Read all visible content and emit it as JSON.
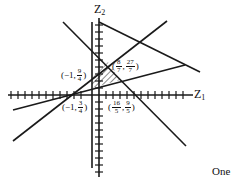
{
  "axes": {
    "x_label": "Z",
    "x_sub": "1",
    "y_label": "Z",
    "y_sub": "2"
  },
  "points": [
    {
      "id": "p1",
      "open": "(",
      "x": "−1,",
      "num": "9",
      "den": "4",
      "close": ")"
    },
    {
      "id": "p2",
      "open": "(",
      "xnum": "8",
      "xden": "7",
      "comma": ",",
      "num": "27",
      "den": "7",
      "close": ")"
    },
    {
      "id": "p3",
      "open": "(",
      "x": "−1,",
      "num": "3",
      "den": "4",
      "close": ")"
    },
    {
      "id": "p4",
      "open": "(",
      "xnum": "16",
      "xden": "5",
      "comma": ",",
      "num": "9",
      "den": "5",
      "close": ")"
    }
  ],
  "caption": "One",
  "colors": {
    "line": "#1a1a1a",
    "background": "#ffffff"
  }
}
